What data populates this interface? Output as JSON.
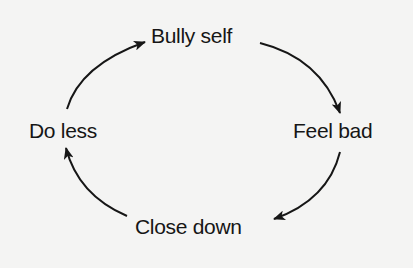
{
  "diagram": {
    "type": "cycle",
    "nodes": [
      {
        "id": "top",
        "label": "Bully self"
      },
      {
        "id": "right",
        "label": "Feel bad"
      },
      {
        "id": "bottom",
        "label": "Close down"
      },
      {
        "id": "left",
        "label": "Do less"
      }
    ],
    "edges": [
      {
        "from": "Bully self",
        "to": "Feel bad",
        "direction": "clockwise"
      },
      {
        "from": "Feel bad",
        "to": "Close down",
        "direction": "clockwise"
      },
      {
        "from": "Close down",
        "to": "Do less",
        "direction": "clockwise"
      },
      {
        "from": "Do less",
        "to": "Bully self",
        "direction": "clockwise"
      }
    ],
    "colors": {
      "background": "#f4f4f3",
      "ink": "#161616"
    }
  }
}
